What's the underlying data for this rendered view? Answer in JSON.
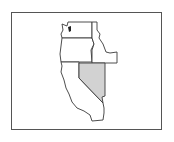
{
  "map": {
    "title": "",
    "region": "Western United States",
    "highlighted_state": "Nevada",
    "states": [
      {
        "name": "Washington",
        "highlighted": false
      },
      {
        "name": "Oregon",
        "highlighted": false
      },
      {
        "name": "Idaho",
        "highlighted": false
      },
      {
        "name": "California",
        "highlighted": false
      },
      {
        "name": "Nevada",
        "highlighted": true
      }
    ],
    "colors": {
      "highlight_fill": "#d2d2d2",
      "default_fill": "#ffffff",
      "border": "#3a3a3a",
      "frame": "#555555"
    }
  }
}
